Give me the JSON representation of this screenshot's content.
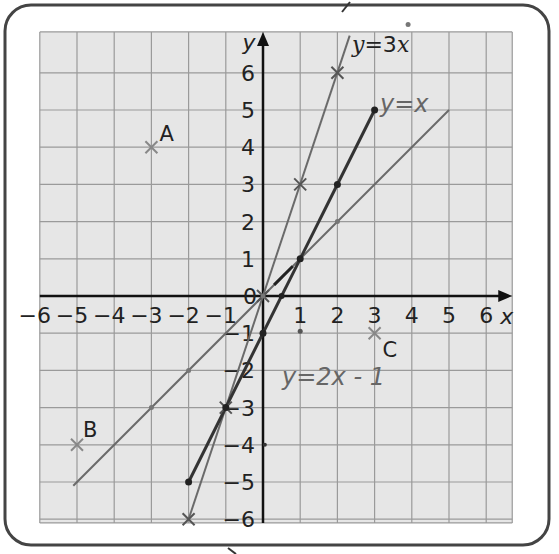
{
  "chart_data": {
    "type": "line",
    "title": "",
    "xlabel": "x",
    "ylabel": "y",
    "xlim": [
      -6,
      6
    ],
    "ylim": [
      -6,
      6
    ],
    "grid": true,
    "x_ticks": [
      "-6",
      "-5",
      "-4",
      "-3",
      "-2",
      "-1",
      "1",
      "2",
      "3",
      "4",
      "5",
      "6"
    ],
    "y_ticks": [
      "6",
      "5",
      "4",
      "3",
      "2",
      "1",
      "-1",
      "-2",
      "-3",
      "-4",
      "-5",
      "-6"
    ],
    "origin_label": "0",
    "series": [
      {
        "name": "y=3x",
        "label": "y = 3x",
        "kind": "printed",
        "x": [
          -2,
          -1,
          0,
          1,
          2
        ],
        "y": [
          -6,
          -3,
          0,
          3,
          6
        ],
        "extend_to": [
          2.3,
          6.9
        ]
      },
      {
        "name": "y=x",
        "label": "y=x",
        "kind": "handwritten",
        "x": [
          -5,
          -3,
          -2,
          0,
          1,
          2,
          5
        ],
        "y": [
          -5,
          -3,
          -2,
          0,
          1,
          2,
          5
        ]
      },
      {
        "name": "y=2x-1",
        "label": "y=2x - 1",
        "kind": "handwritten",
        "x": [
          -2,
          -1,
          0,
          1,
          2,
          3
        ],
        "y": [
          -5,
          -3,
          -1,
          1,
          3,
          5
        ]
      }
    ],
    "points": [
      {
        "label": "A",
        "x": -3,
        "y": 4
      },
      {
        "label": "B",
        "x": -5,
        "y": -4
      },
      {
        "label": "C",
        "x": 3,
        "y": -1
      }
    ]
  },
  "labels": {
    "y_axis": "y",
    "x_axis": "x",
    "eq_3x_y": "y",
    "eq_3x_rest": "=3",
    "eq_3x_x": "x",
    "hand_y_eq_x": "y=x",
    "hand_y_eq_2x_minus_1": "y=2x - 1"
  }
}
